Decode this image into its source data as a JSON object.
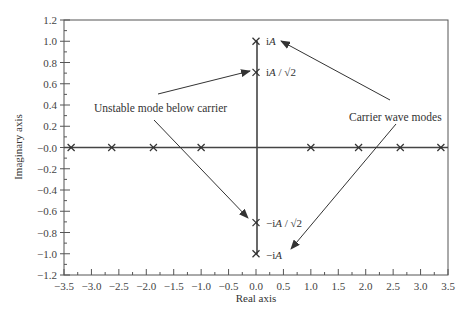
{
  "chart_data": {
    "type": "scatter",
    "title": "",
    "xlabel": "Real axis",
    "ylabel": "Imaginary axis",
    "xlim": [
      -3.5,
      3.5
    ],
    "ylim": [
      -1.2,
      1.2
    ],
    "x_ticks": [
      "-3.5",
      "-3.0",
      "-2.5",
      "-2.0",
      "-1.5",
      "-1.0",
      "-0.5",
      "0.0",
      "0.5",
      "1.0",
      "1.5",
      "2.0",
      "2.5",
      "3.0",
      "3.5"
    ],
    "y_ticks": [
      "1.2",
      "1.0",
      "0.8",
      "0.6",
      "0.4",
      "0.2",
      "-0.0",
      "-0.2",
      "-0.4",
      "-0.6",
      "-0.8",
      "-1.0",
      "-1.2"
    ],
    "grid": false,
    "legend": null,
    "series": [
      {
        "name": "Real-axis modes",
        "marker": "x",
        "points": [
          [
            -3.37,
            0
          ],
          [
            -2.63,
            0
          ],
          [
            -1.87,
            0
          ],
          [
            -1.0,
            0
          ],
          [
            1.0,
            0
          ],
          [
            1.87,
            0
          ],
          [
            2.63,
            0
          ],
          [
            3.37,
            0
          ]
        ]
      },
      {
        "name": "Imaginary-axis modes",
        "marker": "x",
        "points": [
          [
            0,
            1.0
          ],
          [
            0,
            0.707
          ],
          [
            0,
            -0.707
          ],
          [
            0,
            -1.0
          ]
        ],
        "labels": [
          "iA",
          "iA/√2",
          "−iA/√2",
          "−iA"
        ]
      }
    ],
    "annotations": [
      {
        "text": "Unstable mode below carrier",
        "points_to": [
          "iA/√2",
          "−iA/√2"
        ]
      },
      {
        "text": "Carrier wave modes",
        "points_to": [
          "iA",
          "−iA"
        ]
      }
    ]
  },
  "labels": {
    "xlabel": "Real axis",
    "ylabel": "Imaginary axis",
    "unstable": "Unstable mode below carrier",
    "carrier": "Carrier wave modes",
    "iA_label": "i",
    "iA_var": "A",
    "iA_sqrt_var": "A",
    "sqrt2": "√2"
  }
}
